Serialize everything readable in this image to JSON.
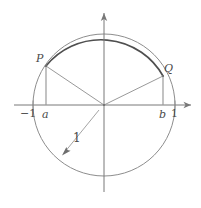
{
  "figure": {
    "type": "unit-circle-diagram",
    "labels": {
      "point_p": "P",
      "point_q": "Q",
      "x_neg_one": "−1",
      "x_a": "a",
      "x_b": "b",
      "x_one": "1",
      "radius": "1"
    },
    "colors": {
      "circle": "#8a8a8a",
      "highlight_arc": "#5a5a5a",
      "axis": "#7a7a7a",
      "text": "#4a4a4a"
    },
    "geometry": {
      "center_x": 104,
      "center_y": 105,
      "radius_px": 71,
      "point_p_x": 46,
      "point_p_y": 66,
      "point_q_x": 163,
      "point_q_y": 76
    }
  }
}
